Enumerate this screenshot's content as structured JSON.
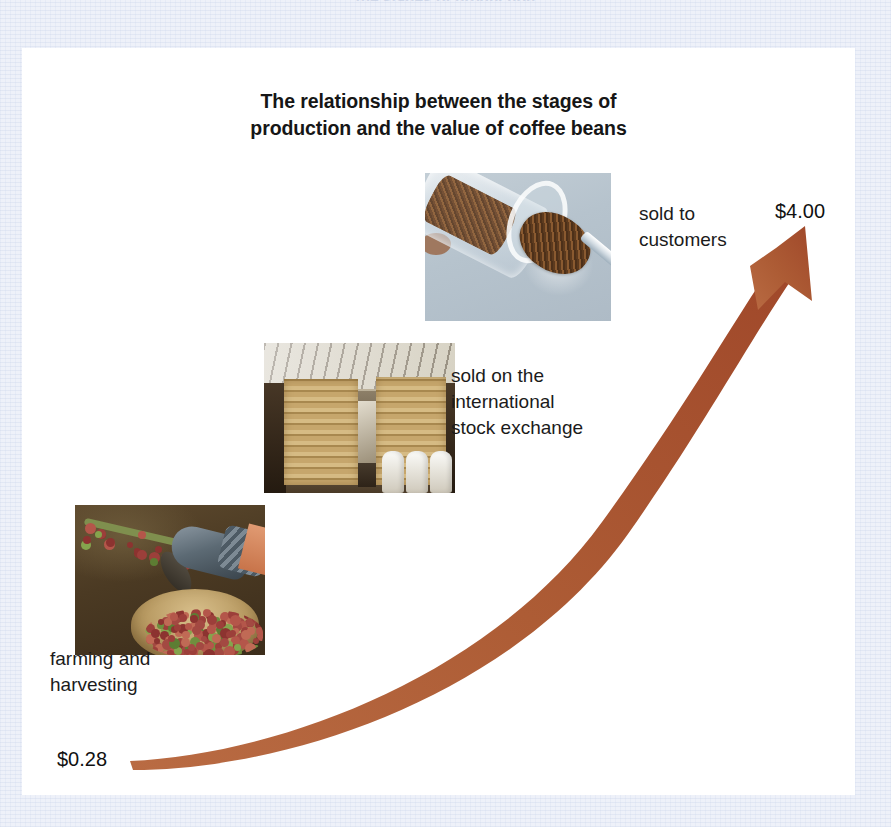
{
  "page": {
    "background_color": "#eef1f9",
    "card_color": "#ffffff",
    "top_cut_text": "…the stages of production…"
  },
  "title": {
    "line1": "The relationship between the stages of",
    "line2": "production and the value of coffee beans",
    "full": "The relationship between the stages of production and the value of coffee beans"
  },
  "arrow": {
    "color": "#ab5630",
    "name": "rising-value-arrow",
    "direction": "up-right",
    "start_label": "$0.28",
    "end_label": "$4.00"
  },
  "stages": [
    {
      "id": "farming",
      "caption": "farming and\nharvesting",
      "value": "$0.28",
      "photo_name": "photo-harvesting-coffee-cherries",
      "photo_alt": "Gloved hand picking red coffee cherries from a branch into a woven basket"
    },
    {
      "id": "exchange",
      "caption": "sold on the\ninternational\nstock exchange",
      "photo_name": "photo-warehouse-coffee-sacks",
      "photo_alt": "Stacks of burlap coffee sacks piled high inside a warehouse"
    },
    {
      "id": "customers",
      "caption": "sold to\ncustomers",
      "value": "$4.00",
      "photo_name": "photo-instant-coffee-jar-spoon",
      "photo_alt": "Jar of ground coffee tipped over pouring onto a metal spoon"
    }
  ],
  "chart_data": {
    "type": "line",
    "title": "The relationship between the stages of production and the value of coffee beans",
    "xlabel": "stage of production",
    "ylabel": "value of coffee beans (USD)",
    "categories": [
      "farming and harvesting",
      "sold on the international stock exchange",
      "sold to customers"
    ],
    "values": [
      0.28,
      1.2,
      4.0
    ],
    "value_labels": [
      "$0.28",
      "",
      "$4.00"
    ],
    "ylim": [
      0,
      4.0
    ],
    "grid": false,
    "legend": "none",
    "annotations": [
      {
        "text": "farming and harvesting",
        "value": "$0.28"
      },
      {
        "text": "sold on the international stock exchange",
        "value": ""
      },
      {
        "text": "sold to customers",
        "value": "$4.00"
      }
    ],
    "series": [
      {
        "name": "value of coffee beans",
        "values": [
          0.28,
          1.2,
          4.0
        ]
      }
    ]
  }
}
